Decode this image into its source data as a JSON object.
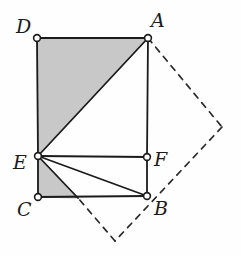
{
  "figure": {
    "canvas": {
      "width": 241,
      "height": 256
    },
    "style": {
      "background_color": "#fefefe",
      "stroke_color": "#1b1b1b",
      "shade_color": "#c8c8c8",
      "shade_stroke": "#6f6f6f",
      "vertex_fill": "#ffffff",
      "stroke_width": 1.7,
      "dash_pattern": "6 6"
    },
    "points": {
      "D": {
        "x": 37,
        "y": 38,
        "label": "D",
        "label_x": 16,
        "label_y": 17
      },
      "A": {
        "x": 148,
        "y": 38,
        "label": "A",
        "label_x": 151,
        "label_y": 11
      },
      "E": {
        "x": 38,
        "y": 156,
        "label": "E",
        "label_x": 13,
        "label_y": 153
      },
      "F": {
        "x": 147,
        "y": 157,
        "label": "F",
        "label_x": 154,
        "label_y": 150
      },
      "C": {
        "x": 38,
        "y": 197,
        "label": "C",
        "label_x": 17,
        "label_y": 200
      },
      "B": {
        "x": 147,
        "y": 196,
        "label": "B",
        "label_x": 154,
        "label_y": 199
      },
      "G": {
        "x": 78,
        "y": 198,
        "label": "",
        "label_x": 0,
        "label_y": 0
      },
      "P_right": {
        "x": 222,
        "y": 127,
        "label": "",
        "label_x": 0,
        "label_y": 0
      },
      "P_bottom": {
        "x": 115,
        "y": 241,
        "label": "",
        "label_x": 0,
        "label_y": 0
      }
    },
    "shaded_regions": [
      {
        "name": "upper-shaded-triangle-DAE",
        "polygon": "37,38 148,38 38,156",
        "description": "Triangle D-A-E filled light gray"
      },
      {
        "name": "lower-shaded-triangle-ECG",
        "polygon": "38,156 38,197 78,198",
        "description": "Triangle E-C-G filled light gray"
      }
    ],
    "solid_edges": [
      {
        "name": "edge-D-A",
        "from": "D",
        "to": "A"
      },
      {
        "name": "edge-D-E",
        "from": "D",
        "to": "E"
      },
      {
        "name": "edge-E-C",
        "from": "E",
        "to": "C"
      },
      {
        "name": "edge-C-B",
        "from": "C",
        "to": "B"
      },
      {
        "name": "edge-B-F",
        "from": "B",
        "to": "F"
      },
      {
        "name": "edge-F-A",
        "from": "F",
        "to": "A"
      },
      {
        "name": "edge-E-A",
        "from": "E",
        "to": "A"
      },
      {
        "name": "edge-E-F",
        "from": "E",
        "to": "F"
      },
      {
        "name": "edge-E-B",
        "from": "E",
        "to": "B"
      },
      {
        "name": "edge-E-G",
        "from": "E",
        "to": "G"
      }
    ],
    "dashed_edges": [
      {
        "name": "dashed-edge-A-Pright",
        "from": "A",
        "to": "P_right"
      },
      {
        "name": "dashed-edge-Pright-Pbottom",
        "from": "P_right",
        "to": "P_bottom"
      },
      {
        "name": "dashed-edge-Pbottom-G",
        "from": "P_bottom",
        "to": "G"
      }
    ],
    "vertex_markers": [
      "D",
      "A",
      "E",
      "F",
      "C",
      "B"
    ],
    "labels_order": [
      "D",
      "A",
      "E",
      "F",
      "C",
      "B"
    ]
  }
}
